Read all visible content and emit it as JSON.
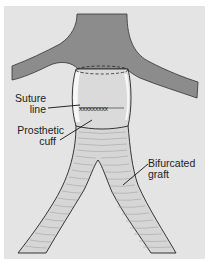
{
  "diagram": {
    "type": "anatomical-illustration",
    "labels": {
      "suture_line": [
        "Suture",
        "line"
      ],
      "prosthetic_cuff": [
        "Prosthetic",
        "cuff"
      ],
      "bifurcated_graft": [
        "Bifurcated",
        "graft"
      ]
    },
    "suture_marks": "xxxxxxxxx",
    "colors": {
      "background": "#e4e4e4",
      "border": "#ffffff",
      "aorta": "#8c8c8c",
      "cuff": "#dcdcdc",
      "cuff_highlight": "#f6f6f6",
      "graft": "#d8d8d8",
      "outline": "#222222"
    }
  }
}
